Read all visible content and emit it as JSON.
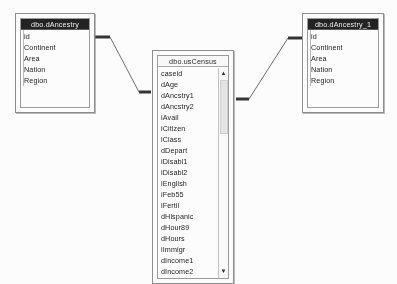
{
  "diagram": {
    "background_color": "#ffffff",
    "line_color": "#4a4a4a"
  },
  "tables": [
    {
      "id": "dAncestry",
      "title": "dbo.dAncestry",
      "title_style": "dark",
      "fields": [
        "id",
        "Continent",
        "Area",
        "Nation",
        "Region"
      ],
      "has_scrollbar": false
    },
    {
      "id": "usCensus",
      "title": "dbo.usCensus",
      "title_style": "light",
      "fields": [
        "caseid",
        "dAge",
        "dAncstry1",
        "dAncstry2",
        "iAvail",
        "iCitizen",
        "iClass",
        "dDepart",
        "iDisabl1",
        "iDisabl2",
        "iEnglish",
        "iFeb55",
        "iFertil",
        "dHispanic",
        "dHour89",
        "dHours",
        "iImmigr",
        "dIncome1",
        "dIncome2",
        "dIncome3",
        "dIncome4"
      ],
      "has_scrollbar": true,
      "scrollbar": {
        "up_arrow": "scroll-up-arrow",
        "down_arrow": "scroll-down-arrow",
        "thumb": "scroll-thumb"
      }
    },
    {
      "id": "dAncestry_1",
      "title": "dbo.dAncestry_1",
      "title_style": "dark",
      "fields": [
        "id",
        "Continent",
        "Area",
        "Nation",
        "Region"
      ],
      "has_scrollbar": false
    }
  ],
  "relationships": [
    {
      "id": "rel-dancestry-uscensus",
      "from_table": "dAncestry",
      "to_table": "usCensus"
    },
    {
      "id": "rel-uscensus-dancestry1",
      "from_table": "usCensus",
      "to_table": "dAncestry_1"
    }
  ]
}
